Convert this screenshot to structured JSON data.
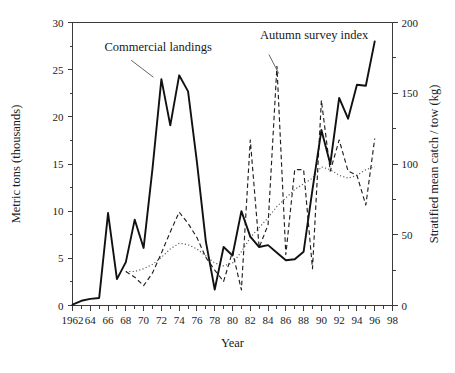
{
  "chart_data": {
    "type": "line",
    "title": "",
    "xlabel": "Year",
    "ylabel": "Metric tons (thousands)",
    "y2label": "Stratified mean catch / tow (kg)",
    "xlim": [
      1962,
      1998
    ],
    "ylim": [
      0,
      30
    ],
    "y2lim": [
      0,
      200
    ],
    "grid": false,
    "legend_position": "inline-annotations",
    "xticks": [
      "1962",
      "64",
      "66",
      "68",
      "70",
      "72",
      "74",
      "76",
      "78",
      "80",
      "82",
      "84",
      "86",
      "88",
      "90",
      "92",
      "94",
      "96",
      "98"
    ],
    "xtick_values": [
      1962,
      1964,
      1966,
      1968,
      1970,
      1972,
      1974,
      1976,
      1978,
      1980,
      1982,
      1984,
      1986,
      1988,
      1990,
      1992,
      1994,
      1996,
      1998
    ],
    "xtick_minor_values": [
      1963,
      1965,
      1967,
      1969,
      1971,
      1973,
      1975,
      1977,
      1979,
      1981,
      1983,
      1985,
      1987,
      1989,
      1991,
      1993,
      1995,
      1997
    ],
    "yticks": [
      "0",
      "5",
      "10",
      "15",
      "20",
      "25",
      "30"
    ],
    "ytick_values": [
      0,
      5,
      10,
      15,
      20,
      25,
      30
    ],
    "y2ticks": [
      "0",
      "50",
      "100",
      "150",
      "200"
    ],
    "y2tick_values": [
      0,
      50,
      100,
      150,
      200
    ],
    "y2tick_minor_values": [
      25,
      75,
      125,
      175
    ],
    "annotations": [
      {
        "name": "commercial-landings-label",
        "text": "Commercial landings",
        "text_x": 1965.6,
        "text_y": 27.0,
        "leader_from_x": 1968.6,
        "leader_from_y": 26.0,
        "leader_to_x": 1971.1,
        "leader_to_y": 24.2
      },
      {
        "name": "autumn-survey-index-label",
        "text": "Autumn survey index",
        "text_x": 1983.1,
        "text_y": 28.3,
        "leader_from_x": 1984.1,
        "leader_from_y": 26.6,
        "leader_to_x": 1985.2,
        "leader_to_y": 24.6
      }
    ],
    "series": [
      {
        "name": "Commercial landings",
        "style": "solid",
        "axis": "left",
        "units": "metric tons (thousands)",
        "x": [
          1962,
          1963,
          1964,
          1965,
          1966,
          1967,
          1968,
          1969,
          1970,
          1971,
          1972,
          1973,
          1974,
          1975,
          1976,
          1977,
          1978,
          1979,
          1980,
          1981,
          1982,
          1983,
          1984,
          1985,
          1986,
          1987,
          1988,
          1989,
          1990,
          1991,
          1992,
          1993,
          1994,
          1995,
          1996
        ],
        "values": [
          0.1,
          0.5,
          0.7,
          0.8,
          9.8,
          2.8,
          4.6,
          9.1,
          6.1,
          14.5,
          24.0,
          19.1,
          24.4,
          22.7,
          15.2,
          6.8,
          1.7,
          6.2,
          5.3,
          10.0,
          7.3,
          6.2,
          6.4,
          5.6,
          4.8,
          4.9,
          5.7,
          12.3,
          18.6,
          15.0,
          22.0,
          19.8,
          23.4,
          23.3,
          28.0
        ]
      },
      {
        "name": "Autumn survey index",
        "style": "dashed",
        "axis": "right",
        "units": "stratified mean catch / tow (kg)",
        "x": [
          1968,
          1969,
          1970,
          1971,
          1972,
          1973,
          1974,
          1975,
          1976,
          1977,
          1978,
          1979,
          1980,
          1981,
          1982,
          1983,
          1984,
          1985,
          1986,
          1987,
          1988,
          1989,
          1990,
          1991,
          1992,
          1993,
          1994,
          1995,
          1996
        ],
        "values": [
          24,
          20,
          14,
          23,
          37,
          52,
          66,
          58,
          48,
          34,
          25,
          17,
          38,
          11,
          117,
          41,
          57,
          169,
          36,
          96,
          96,
          26,
          145,
          95,
          117,
          95,
          92,
          71,
          118
        ]
      },
      {
        "name": "Smoothed survey trend",
        "style": "dotted",
        "axis": "right",
        "units": "stratified mean catch / tow (kg)",
        "x": [
          1968,
          1969,
          1970,
          1971,
          1972,
          1973,
          1974,
          1975,
          1976,
          1977,
          1978,
          1979,
          1980,
          1981,
          1982,
          1983,
          1984,
          1985,
          1986,
          1987,
          1988,
          1989,
          1990,
          1991,
          1992,
          1993,
          1994,
          1995,
          1996
        ],
        "values": [
          24,
          24,
          26,
          29,
          34,
          40,
          44,
          43,
          40,
          35,
          30,
          28,
          30,
          38,
          48,
          55,
          62,
          70,
          76,
          82,
          86,
          90,
          98,
          96,
          92,
          90,
          92,
          96,
          98
        ]
      }
    ]
  }
}
